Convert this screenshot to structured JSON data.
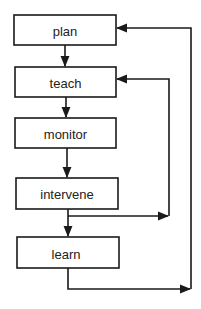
{
  "diagram": {
    "type": "flowchart",
    "nodes": [
      {
        "id": "plan",
        "label": "plan"
      },
      {
        "id": "teach",
        "label": "teach"
      },
      {
        "id": "monitor",
        "label": "monitor"
      },
      {
        "id": "intervene",
        "label": "intervene"
      },
      {
        "id": "learn",
        "label": "learn"
      }
    ],
    "edges": [
      {
        "from": "plan",
        "to": "teach"
      },
      {
        "from": "teach",
        "to": "monitor"
      },
      {
        "from": "monitor",
        "to": "intervene"
      },
      {
        "from": "intervene",
        "to": "learn"
      },
      {
        "from": "intervene",
        "to": "teach",
        "kind": "feedback-loop"
      },
      {
        "from": "learn",
        "to": "plan",
        "kind": "feedback-loop"
      }
    ],
    "colors": {
      "stroke": "#1a1a1a",
      "background": "#ffffff",
      "text": "#222222"
    }
  }
}
